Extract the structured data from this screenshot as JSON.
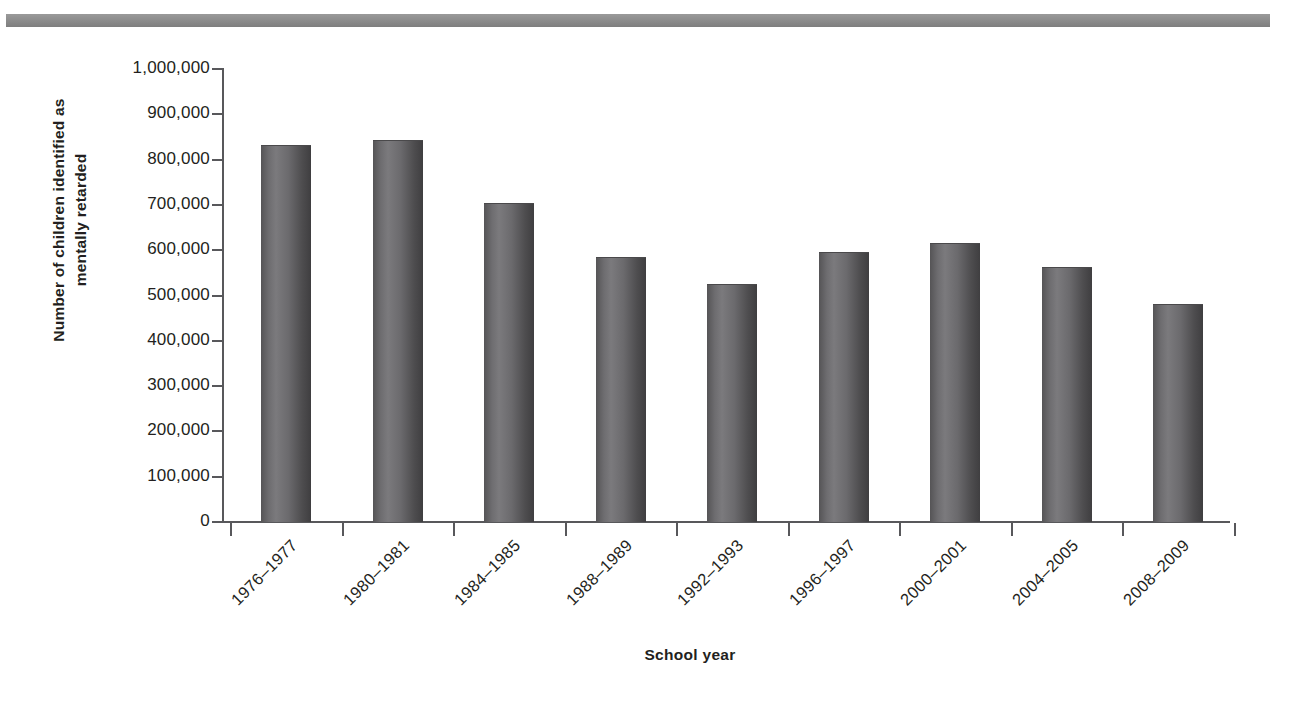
{
  "decor": {
    "top_rule_color": "#8d8d8d"
  },
  "chart_data": {
    "type": "bar",
    "title": "",
    "xlabel": "School year",
    "ylabel": "Number of children identified as mentally retarded",
    "ylabel_line1": "Number of children identified as",
    "ylabel_line2": "mentally retarded",
    "categories": [
      "1976–1977",
      "1980–1981",
      "1984–1985",
      "1988–1989",
      "1992–1993",
      "1996–1997",
      "2000–2001",
      "2004–2005",
      "2008–2009"
    ],
    "values": [
      830000,
      842000,
      703000,
      582000,
      524000,
      594000,
      614000,
      560000,
      478000
    ],
    "ylim": [
      0,
      1000000
    ],
    "ytick_labels": [
      "0",
      "100,000",
      "200,000",
      "300,000",
      "400,000",
      "500,000",
      "600,000",
      "700,000",
      "800,000",
      "900,000",
      "1,000,000"
    ],
    "ytick_values": [
      0,
      100000,
      200000,
      300000,
      400000,
      500000,
      600000,
      700000,
      800000,
      900000,
      1000000
    ],
    "grid": false,
    "legend": null,
    "bar_color": "#6b6a6d",
    "axis_color": "#58585b"
  }
}
